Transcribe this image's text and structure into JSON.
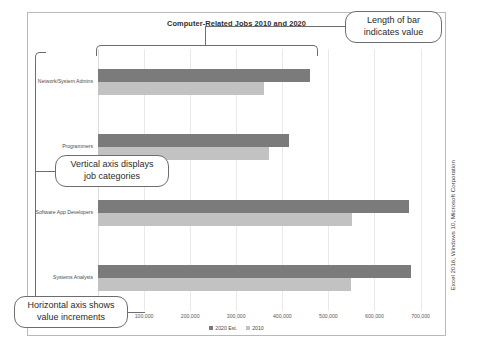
{
  "chart_data": {
    "type": "bar",
    "orientation": "horizontal",
    "title": "Computer-Related Jobs 2010 and 2020",
    "xlabel": "",
    "ylabel": "",
    "categories": [
      "Network/System Admins",
      "Programmers",
      "Software App Developers",
      "Systems Analysts"
    ],
    "series": [
      {
        "name": "2020 Est.",
        "color": "#7b7b7b",
        "values": [
          460000,
          415000,
          675000,
          680000
        ]
      },
      {
        "name": "2010",
        "color": "#c2c2c2",
        "values": [
          360000,
          372000,
          552000,
          550000
        ]
      }
    ],
    "xlim": [
      0,
      740000
    ],
    "xticks": [
      100000,
      200000,
      300000,
      400000,
      500000,
      600000,
      700000
    ],
    "xtick_labels": [
      "100,000",
      "200,000",
      "300,000",
      "400,000",
      "500,000",
      "600,000",
      "700,000"
    ],
    "grid": true,
    "legend_position": "bottom"
  },
  "callouts": [
    {
      "id": "length-of-bar",
      "line1": "Length of bar",
      "line2": "indicates value"
    },
    {
      "id": "vertical-axis",
      "line1": "Vertical axis displays",
      "line2": "job categories"
    },
    {
      "id": "horizontal-axis",
      "line1": "Horizontal axis shows",
      "line2": "value increments"
    }
  ],
  "source_caption": "Excel 2016, Windows 10, Microsoft Corporation"
}
